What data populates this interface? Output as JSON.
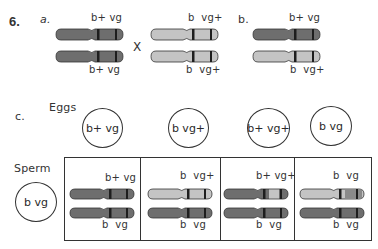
{
  "problem_number": "6.",
  "part_a": {
    "label": "a.",
    "cross_symbol": "X",
    "parent1": {
      "top_label": "b+ vg",
      "bottom_label": "b+ vg",
      "top_color": "dark",
      "bottom_color": "dark"
    },
    "parent2": {
      "top_label": "b  vg+",
      "bottom_label": "b  vg+",
      "top_color": "light",
      "bottom_color": "light"
    }
  },
  "part_b": {
    "label": "b.",
    "offspring": {
      "top_label": "b+ vg",
      "bottom_label": "b  vg+",
      "top_color": "dark",
      "bottom_color": "light"
    }
  },
  "part_c": {
    "label": "c.",
    "eggs_label": "Eggs",
    "sperm_label": "Sperm",
    "eggs": [
      "b+ vg",
      "b vg+",
      "b+ vg+",
      "b vg"
    ],
    "sperm": [
      "b vg"
    ],
    "punnett_cells": [
      {
        "top_label": "b+ vg",
        "bottom_label": "b  vg",
        "top_color": "dark",
        "bottom_color": "dark"
      },
      {
        "top_label": "b  vg+",
        "bottom_label": "b  vg",
        "top_color": "light",
        "bottom_color": "dark"
      },
      {
        "top_label": "b+ vg+",
        "bottom_label": "b  vg",
        "top_color": "dark-recomb",
        "bottom_color": "dark"
      },
      {
        "top_label": "b  vg",
        "bottom_label": "b  vg",
        "top_color": "light-recomb",
        "bottom_color": "dark"
      }
    ]
  },
  "colors": {
    "dark_chromosome": "#6e6e6e",
    "light_chromosome": "#c4c4c4",
    "band": "#1e1e1e",
    "outline": "#333333"
  }
}
